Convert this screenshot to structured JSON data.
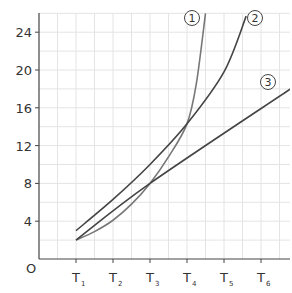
{
  "chart_data": {
    "type": "line",
    "title": "",
    "xlabel": "",
    "ylabel": "",
    "origin_label": "O",
    "x_categories": [
      "T1",
      "T2",
      "T3",
      "T4",
      "T5",
      "T6"
    ],
    "x_tick_labels": [
      {
        "main": "T",
        "sub": "1"
      },
      {
        "main": "T",
        "sub": "2"
      },
      {
        "main": "T",
        "sub": "3"
      },
      {
        "main": "T",
        "sub": "4"
      },
      {
        "main": "T",
        "sub": "5"
      },
      {
        "main": "T",
        "sub": "6"
      }
    ],
    "y_ticks": [
      4,
      8,
      12,
      16,
      20,
      24
    ],
    "ylim": [
      0,
      26
    ],
    "xlim": [
      0,
      6.8
    ],
    "grid": true,
    "legend": "inline circled numbers at curve ends",
    "series": [
      {
        "name": "1",
        "label": "①",
        "shape": "exponential",
        "color": "#777777",
        "x": [
          1,
          1.5,
          2,
          2.5,
          3,
          3.5,
          4,
          4.25,
          4.5
        ],
        "y": [
          2,
          2.9,
          4.1,
          5.8,
          8,
          10.8,
          14.3,
          18.5,
          26
        ]
      },
      {
        "name": "2",
        "label": "②",
        "shape": "curved",
        "color": "#444444",
        "x": [
          1,
          2,
          3,
          4,
          5,
          5.6
        ],
        "y": [
          3,
          6.3,
          10,
          14.3,
          19.8,
          25.7
        ]
      },
      {
        "name": "3",
        "label": "③",
        "shape": "linear",
        "color": "#444444",
        "x": [
          1,
          3,
          6.8
        ],
        "y": [
          2,
          8,
          18
        ]
      }
    ]
  },
  "labels": {
    "origin": "O",
    "series_1": "1",
    "series_2": "2",
    "series_3": "3"
  }
}
